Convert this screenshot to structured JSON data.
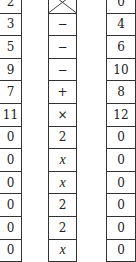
{
  "left_column": [
    "2",
    "3",
    "5",
    "9",
    "7",
    "11",
    "0",
    "0",
    "0",
    "0",
    "0",
    "0"
  ],
  "middle_column": [
    "",
    "−",
    "−",
    "−",
    "+",
    "×",
    "2",
    "x",
    "x",
    "2",
    "2",
    "x"
  ],
  "middle_column_styles": [
    "crossed",
    "op",
    "op",
    "op",
    "op",
    "op",
    "num",
    "var",
    "var",
    "num",
    "num",
    "var"
  ],
  "right_column": [
    "0",
    "4",
    "6",
    "10",
    "8",
    "12",
    "0",
    "0",
    "0",
    "0",
    "0",
    "0"
  ]
}
